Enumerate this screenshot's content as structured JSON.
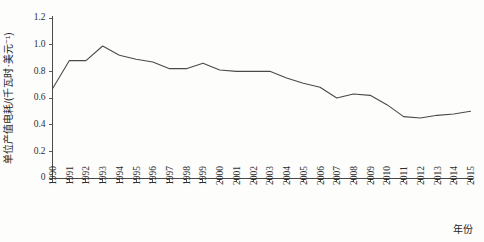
{
  "chart_data": {
    "type": "line",
    "title": "",
    "xlabel": "年份",
    "ylabel": "单位产值电耗/(千瓦时·美元⁻¹)",
    "xlim": [
      1990,
      2015
    ],
    "ylim": [
      0,
      1.2
    ],
    "ytick_labels": [
      "0",
      "0.2",
      "0.4",
      "0.6",
      "0.8",
      "1.0",
      "1.2"
    ],
    "ytick_values": [
      0,
      0.2,
      0.4,
      0.6,
      0.8,
      1.0,
      1.2
    ],
    "grid": false,
    "legend": null,
    "line_color": "#4a4a4a",
    "categories": [
      "1990",
      "1991",
      "1992",
      "1993",
      "1994",
      "1995",
      "1996",
      "1997",
      "1998",
      "1999",
      "2000",
      "2001",
      "2002",
      "2003",
      "2004",
      "2005",
      "2006",
      "2007",
      "2008",
      "2009",
      "2010",
      "2011",
      "2012",
      "2013",
      "2014",
      "2015"
    ],
    "x": [
      1990,
      1991,
      1992,
      1993,
      1994,
      1995,
      1996,
      1997,
      1998,
      1999,
      2000,
      2001,
      2002,
      2003,
      2004,
      2005,
      2006,
      2007,
      2008,
      2009,
      2010,
      2011,
      2012,
      2013,
      2014,
      2015
    ],
    "values": [
      0.67,
      0.88,
      0.88,
      0.99,
      0.92,
      0.89,
      0.87,
      0.82,
      0.82,
      0.86,
      0.81,
      0.8,
      0.8,
      0.8,
      0.75,
      0.71,
      0.68,
      0.6,
      0.63,
      0.62,
      0.55,
      0.46,
      0.45,
      0.47,
      0.48,
      0.5
    ],
    "series": [
      {
        "name": "单位产值电耗",
        "values": [
          0.67,
          0.88,
          0.88,
          0.99,
          0.92,
          0.89,
          0.87,
          0.82,
          0.82,
          0.86,
          0.81,
          0.8,
          0.8,
          0.8,
          0.75,
          0.71,
          0.68,
          0.6,
          0.63,
          0.62,
          0.55,
          0.46,
          0.45,
          0.47,
          0.48,
          0.5
        ]
      }
    ]
  }
}
